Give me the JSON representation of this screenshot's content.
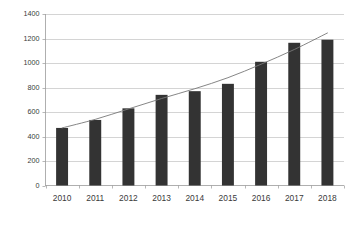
{
  "chart_data": {
    "type": "bar",
    "title": "",
    "subtitle": "",
    "xlabel": "",
    "ylabel": "",
    "categories": [
      "2010",
      "2011",
      "2012",
      "2013",
      "2014",
      "2015",
      "2016",
      "2017",
      "2018"
    ],
    "values": [
      470,
      535,
      630,
      740,
      770,
      830,
      1010,
      1165,
      1190
    ],
    "series": [
      {
        "name": "bars",
        "type": "bar",
        "values": [
          470,
          535,
          630,
          740,
          770,
          830,
          1010,
          1165,
          1190
        ]
      },
      {
        "name": "trendline",
        "type": "line",
        "values": [
          470,
          540,
          625,
          710,
          790,
          880,
          990,
          1110,
          1245
        ]
      }
    ],
    "ylim": [
      0,
      1400
    ],
    "yticks": [
      0,
      200,
      400,
      600,
      800,
      1000,
      1200,
      1400
    ],
    "ytick_labels": [
      "0",
      "200",
      "400",
      "600",
      "800",
      "1000",
      "1200",
      "1400"
    ],
    "xtick_labels": [
      "2010",
      "2011",
      "2012",
      "2013",
      "2014",
      "2015",
      "2016",
      "2017",
      "2018"
    ],
    "grid": "horizontal",
    "legend": "none",
    "annotations": [],
    "colors": {
      "bar": "#333333",
      "trendline": "#787878",
      "gridline": "#c2c2c2",
      "axis": "#9a9a9a",
      "background": "#ffffff",
      "tick_text": "#3a3a3a"
    }
  }
}
